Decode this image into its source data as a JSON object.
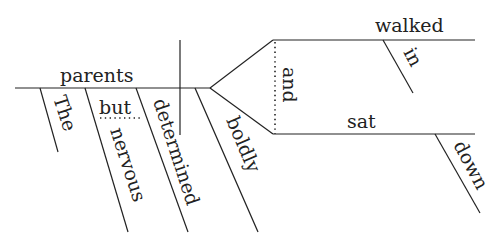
{
  "diagram": {
    "type": "sentence-diagram",
    "sentence": "The parents, nervous but determined, boldly walked in and sat down.",
    "subject": "parents",
    "subject_modifiers": [
      "The",
      "nervous",
      "determined"
    ],
    "modifier_conjunction": "but",
    "verb_modifier_shared": "boldly",
    "predicate_conjunction": "and",
    "predicates": [
      {
        "verb": "walked",
        "modifier": "in"
      },
      {
        "verb": "sat",
        "modifier": "down"
      }
    ]
  }
}
